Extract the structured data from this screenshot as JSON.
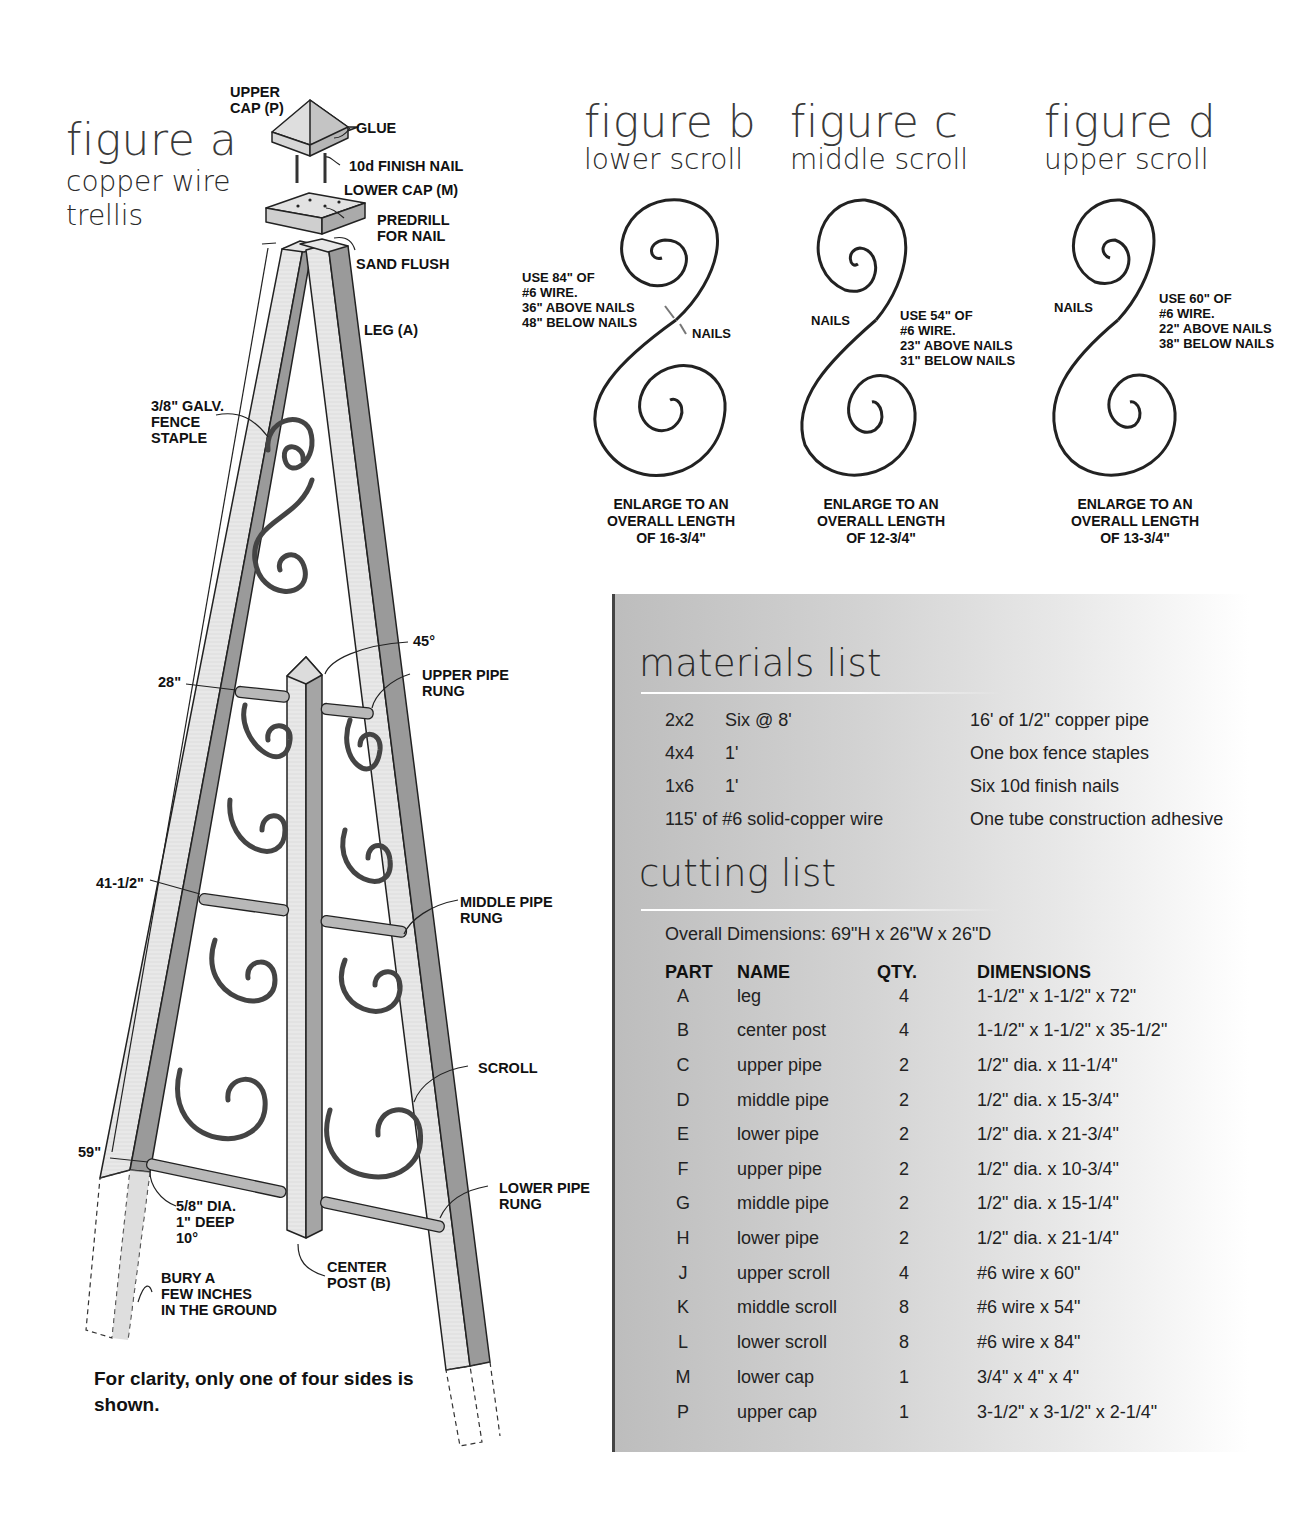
{
  "figure_a": {
    "title": "figure a",
    "subtitle_line1": "copper wire",
    "subtitle_line2": "trellis",
    "callouts": {
      "upper_cap": "UPPER\nCAP (P)",
      "glue": "GLUE",
      "finish_nail": "10d FINISH NAIL",
      "lower_cap": "LOWER CAP (M)",
      "predrill": "PREDRILL\nFOR NAIL",
      "sand_flush": "SAND FLUSH",
      "leg": "LEG (A)",
      "fence_staple": "3/8\" GALV.\nFENCE\nSTAPLE",
      "angle_45": "45°",
      "upper_pipe_rung": "UPPER PIPE\nRUNG",
      "middle_pipe_rung": "MIDDLE PIPE\nRUNG",
      "scroll": "SCROLL",
      "lower_pipe_rung": "LOWER PIPE\nRUNG",
      "hole_spec": "5/8\" DIA.\n1\" DEEP\n10°",
      "center_post": "CENTER\nPOST (B)",
      "bury": "BURY A\nFEW INCHES\nIN THE GROUND"
    },
    "dimensions": {
      "upper": "28\"",
      "middle": "41-1/2\"",
      "lower": "59\""
    },
    "caption": "For clarity, only one of four sides is shown."
  },
  "figure_b": {
    "title": "figure b",
    "subtitle": "lower scroll",
    "note": "USE 84\" OF\n#6 WIRE.\n36\" ABOVE NAILS\n48\" BELOW NAILS",
    "nails_label": "NAILS",
    "enlarge": "ENLARGE TO AN\nOVERALL LENGTH\nOF 16-3/4\""
  },
  "figure_c": {
    "title": "figure c",
    "subtitle": "middle scroll",
    "note": "USE 54\" OF\n#6 WIRE.\n23\" ABOVE NAILS\n31\" BELOW NAILS",
    "nails_label": "NAILS",
    "enlarge": "ENLARGE TO AN\nOVERALL LENGTH\nOF 12-3/4\""
  },
  "figure_d": {
    "title": "figure d",
    "subtitle": "upper scroll",
    "note": "USE 60\" OF\n#6 WIRE.\n22\" ABOVE NAILS\n38\" BELOW NAILS",
    "nails_label": "NAILS",
    "enlarge": "ENLARGE TO AN\nOVERALL LENGTH\nOF 13-3/4\""
  },
  "materials_list": {
    "heading": "materials list",
    "left_items": [
      {
        "size": "2x2",
        "amount": "Six @ 8'"
      },
      {
        "size": "4x4",
        "amount": "1'"
      },
      {
        "size": "1x6",
        "amount": "1'"
      },
      {
        "size": "",
        "amount": "115' of #6 solid-copper wire"
      }
    ],
    "right_items": [
      "16' of 1/2\" copper pipe",
      "One box fence staples",
      "Six 10d finish nails",
      "One tube construction adhesive"
    ]
  },
  "cutting_list": {
    "heading": "cutting list",
    "overall_dimensions": "Overall Dimensions: 69\"H x 26\"W x 26\"D",
    "columns": [
      "PART",
      "NAME",
      "QTY.",
      "DIMENSIONS"
    ],
    "rows": [
      {
        "part": "A",
        "name": "leg",
        "qty": "4",
        "dimensions": "1-1/2\" x 1-1/2\" x 72\""
      },
      {
        "part": "B",
        "name": "center post",
        "qty": "4",
        "dimensions": "1-1/2\" x 1-1/2\" x 35-1/2\""
      },
      {
        "part": "C",
        "name": "upper pipe",
        "qty": "2",
        "dimensions": "1/2\" dia. x 11-1/4\""
      },
      {
        "part": "D",
        "name": "middle pipe",
        "qty": "2",
        "dimensions": "1/2\" dia. x 15-3/4\""
      },
      {
        "part": "E",
        "name": "lower pipe",
        "qty": "2",
        "dimensions": "1/2\" dia. x 21-3/4\""
      },
      {
        "part": "F",
        "name": "upper pipe",
        "qty": "2",
        "dimensions": "1/2\" dia. x 10-3/4\""
      },
      {
        "part": "G",
        "name": "middle pipe",
        "qty": "2",
        "dimensions": "1/2\" dia. x 15-1/4\""
      },
      {
        "part": "H",
        "name": "lower pipe",
        "qty": "2",
        "dimensions": "1/2\" dia. x 21-1/4\""
      },
      {
        "part": "J",
        "name": "upper scroll",
        "qty": "4",
        "dimensions": "#6 wire x 60\""
      },
      {
        "part": "K",
        "name": "middle scroll",
        "qty": "8",
        "dimensions": "#6 wire x 54\""
      },
      {
        "part": "L",
        "name": "lower scroll",
        "qty": "8",
        "dimensions": "#6 wire x 84\""
      },
      {
        "part": "M",
        "name": "lower cap",
        "qty": "1",
        "dimensions": "3/4\" x 4\" x 4\""
      },
      {
        "part": "P",
        "name": "upper cap",
        "qty": "1",
        "dimensions": "3-1/2\" x 3-1/2\" x 2-1/4\""
      }
    ]
  },
  "colors": {
    "wood_light": "#e6e6e6",
    "wood_dark": "#9a9a9a",
    "line": "#222222",
    "panel_border": "#444444",
    "heading_text": "#3a3a3a"
  }
}
